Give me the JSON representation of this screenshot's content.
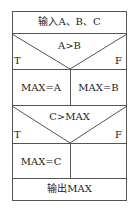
{
  "diagram": {
    "type": "nassi-shneiderman",
    "steps": [
      {
        "kind": "process",
        "text": "输入A、B、C"
      },
      {
        "kind": "decision",
        "condition": "A>B",
        "true_label": "T",
        "false_label": "F",
        "true_branch": "MAX=A",
        "false_branch": "MAX=B"
      },
      {
        "kind": "decision",
        "condition": "C>MAX",
        "true_label": "T",
        "false_label": "F",
        "true_branch": "MAX=C",
        "false_branch": ""
      },
      {
        "kind": "process",
        "text": "输出MAX"
      }
    ],
    "line_color": "#555555"
  }
}
